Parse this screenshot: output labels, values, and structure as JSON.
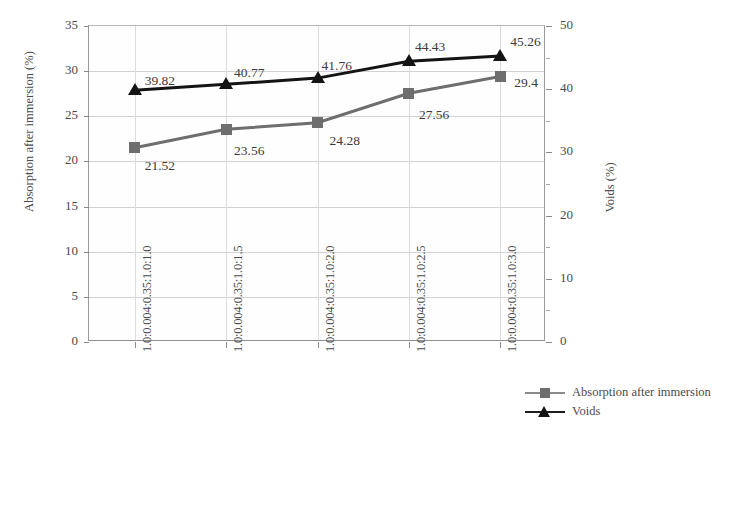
{
  "chart_data": {
    "type": "line",
    "title": "",
    "categories": [
      "1.0:0.004:0.35:1.0:1.0",
      "1.0:0.004:0.35:1.0:1.5",
      "1.0:0.004:0.35:1.0:2.0",
      "1.0:0.004:0.35:1.0:2.5",
      "1.0:0.004:0.35:1.0:3.0"
    ],
    "series": [
      {
        "name": "Absorption after immersion",
        "axis": "left",
        "marker": "square",
        "color": "#6e6e6e",
        "values": [
          21.52,
          23.56,
          24.28,
          27.56,
          29.4
        ],
        "labels": [
          "21.52",
          "23.56",
          "24.28",
          "27.56",
          "29.4"
        ]
      },
      {
        "name": "Voids",
        "axis": "right",
        "marker": "triangle",
        "color": "#141414",
        "values": [
          39.82,
          40.77,
          41.76,
          44.43,
          45.26
        ],
        "labels": [
          "39.82",
          "40.77",
          "41.76",
          "44.43",
          "45.26"
        ]
      }
    ],
    "xlabel": "",
    "ylabel": "Absorption after immersion (%)",
    "y2label": "Voids (%)",
    "ylim": [
      0,
      35
    ],
    "y2lim": [
      0,
      50
    ],
    "yticks": [
      "0",
      "5",
      "10",
      "15",
      "20",
      "25",
      "30",
      "35"
    ],
    "y2ticks": [
      "0",
      "10",
      "20",
      "30",
      "40",
      "50"
    ],
    "grid": true,
    "legend_position": "right"
  },
  "axes": {
    "left_title": "Absorption after immersion (%)",
    "right_title": "Voids (%)",
    "left_ticks": [
      "35",
      "30",
      "25",
      "20",
      "15",
      "10",
      "5",
      "0"
    ],
    "right_ticks": [
      "50",
      "40",
      "30",
      "20",
      "10",
      "0"
    ]
  },
  "legend": {
    "items": [
      {
        "label": "Absorption after immersion",
        "marker": "square-marker"
      },
      {
        "label": "Voids",
        "marker": "triangle-marker"
      }
    ]
  },
  "categories": [
    "1.0:0.004:0.35:1.0:1.0",
    "1.0:0.004:0.35:1.0:1.5",
    "1.0:0.004:0.35:1.0:2.0",
    "1.0:0.004:0.35:1.0:2.5",
    "1.0:0.004:0.35:1.0:3.0"
  ],
  "point_labels": {
    "absorption": [
      "21.52",
      "23.56",
      "24.28",
      "27.56",
      "29.4"
    ],
    "voids": [
      "39.82",
      "40.77",
      "41.76",
      "44.43",
      "45.26"
    ]
  },
  "colors": {
    "absorption": "#6e6e6e",
    "voids": "#141414",
    "grid": "#d2d2d2",
    "axis": "#8a8a8a",
    "text": "#4b4b4b"
  }
}
